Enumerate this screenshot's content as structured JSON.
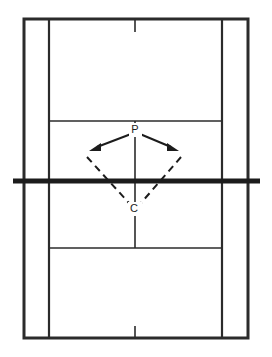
{
  "figure": {
    "name": "badminton-court-movement-diagram",
    "background_color": "#ffffff",
    "line_color": "#2b2b2b",
    "net_color": "#1c1c1c",
    "width": 272,
    "height": 357
  },
  "court": {
    "outer_boundary": {
      "left": 24,
      "right": 248,
      "top": 19,
      "bottom": 338
    },
    "singles_sideline_left_x": 49,
    "singles_sideline_right_x": 222,
    "short_service_line_top_y": 121,
    "short_service_line_bottom_y": 248,
    "net_y": 181,
    "net_extends_left_x": 13,
    "net_extends_right_x": 260,
    "centre_line_x": 135,
    "centre_stub_top": {
      "from_y": 19,
      "to_y": 32
    },
    "centre_stub_bottom": {
      "from_y": 326,
      "to_y": 338
    }
  },
  "markers": [
    {
      "id": "P",
      "label": "P",
      "x": 135,
      "y": 130,
      "description": "player-position-at-net"
    },
    {
      "id": "C",
      "label": "C",
      "x": 134,
      "y": 209,
      "description": "centre-base-position"
    }
  ],
  "shot_arrows": [
    {
      "name": "shot-arrow-left",
      "from_x": 131,
      "from_y": 134,
      "to_x": 91,
      "to_y": 150,
      "style": "solid-with-arrowhead"
    },
    {
      "name": "shot-arrow-right",
      "from_x": 140,
      "from_y": 134,
      "to_x": 177,
      "to_y": 150,
      "style": "solid-with-arrowhead"
    }
  ],
  "recovery_paths": [
    {
      "name": "recovery-path-left",
      "from_x": 88,
      "from_y": 156,
      "to_x": 130,
      "to_y": 204,
      "style": "dashed"
    },
    {
      "name": "recovery-path-right",
      "from_x": 180,
      "from_y": 156,
      "to_x": 140,
      "to_y": 204,
      "style": "dashed"
    }
  ]
}
